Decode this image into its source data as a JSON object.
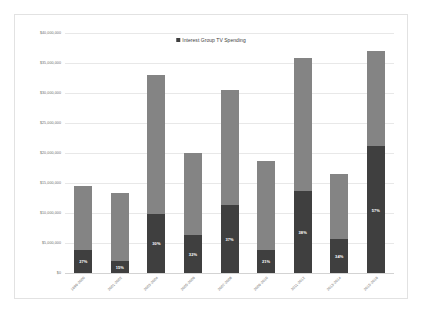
{
  "chart_data": {
    "type": "bar",
    "subtype": "stacked",
    "title": "",
    "xlabel": "",
    "ylabel": "",
    "ylim": [
      0,
      40000000
    ],
    "grid": true,
    "legend_position": "top-center",
    "legend": [
      "Interest Group TV Spending"
    ],
    "ytick_labels": [
      "$40,000,000",
      "$35,000,000",
      "$30,000,000",
      "$25,000,000",
      "$20,000,000",
      "$15,000,000",
      "$10,000,000",
      "$5,000,000",
      "$0"
    ],
    "ytick_values": [
      40000000,
      35000000,
      30000000,
      25000000,
      20000000,
      15000000,
      10000000,
      5000000,
      0
    ],
    "categories": [
      "1999-2000",
      "2001-2002",
      "2003-2004",
      "2005-2006",
      "2007-2008",
      "2009-2010",
      "2011-2012",
      "2013-2014",
      "2015-2016"
    ],
    "series": [
      {
        "name": "Interest Group TV Spending",
        "color": "#3f3f3f",
        "values": [
          3900000,
          2000000,
          9900000,
          6400000,
          11300000,
          3900000,
          13600000,
          5600000,
          21100000
        ]
      },
      {
        "name": "Other TV Spending",
        "color": "#848484",
        "values": [
          10600000,
          11400000,
          23100000,
          13600000,
          19200000,
          14800000,
          22200000,
          10900000,
          15900000
        ]
      }
    ],
    "totals": [
      14500000,
      13400000,
      33000000,
      20000000,
      30500000,
      18700000,
      35800000,
      16500000,
      37000000
    ],
    "data_labels": [
      "27%",
      "15%",
      "30%",
      "32%",
      "37%",
      "21%",
      "38%",
      "34%",
      "57%"
    ]
  },
  "legend": {
    "label": "Interest Group TV Spending"
  }
}
